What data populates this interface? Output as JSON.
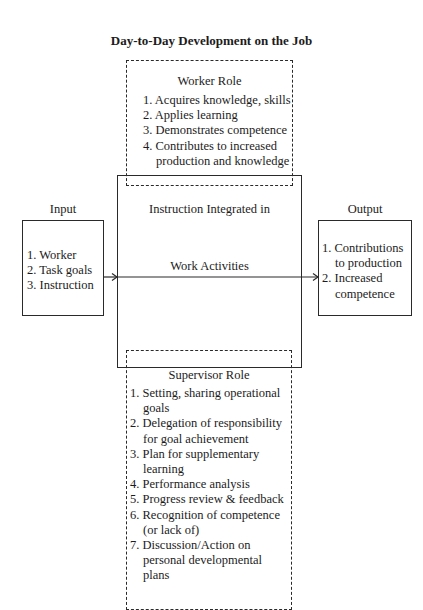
{
  "title": "Day-to-Day Development on the Job",
  "worker_role": {
    "heading": "Worker Role",
    "items": [
      {
        "num": "1.",
        "text": "Acquires knowledge, skills"
      },
      {
        "num": "2.",
        "text": "Applies learning"
      },
      {
        "num": "3.",
        "text": "Demonstrates competence"
      },
      {
        "num": "4.",
        "text": "Contributes to increased",
        "cont": "production and knowledge"
      }
    ]
  },
  "center": {
    "line1": "Instruction Integrated in",
    "line2": "Work Activities"
  },
  "input": {
    "heading": "Input",
    "items": [
      {
        "num": "1.",
        "text": "Worker"
      },
      {
        "num": "2.",
        "text": "Task goals"
      },
      {
        "num": "3.",
        "text": "Instruction"
      }
    ]
  },
  "output": {
    "heading": "Output",
    "items": [
      {
        "num": "1.",
        "text": "Contributions",
        "cont": "to production"
      },
      {
        "num": "2.",
        "text": "Increased",
        "cont": "competence"
      }
    ]
  },
  "supervisor_role": {
    "heading": "Supervisor Role",
    "items": [
      {
        "num": "1.",
        "text": "Setting, sharing operational",
        "cont": "goals"
      },
      {
        "num": "2.",
        "text": "Delegation of responsibility",
        "cont": "for goal achievement"
      },
      {
        "num": "3.",
        "text": "Plan for supplementary",
        "cont": "learning"
      },
      {
        "num": "4.",
        "text": "Performance analysis"
      },
      {
        "num": "5.",
        "text": "Progress review & feedback"
      },
      {
        "num": "6.",
        "text": "Recognition of competence",
        "cont": "(or lack of)"
      },
      {
        "num": "7.",
        "text": "Discussion/Action on",
        "cont": "personal developmental",
        "cont2": "plans"
      }
    ]
  }
}
